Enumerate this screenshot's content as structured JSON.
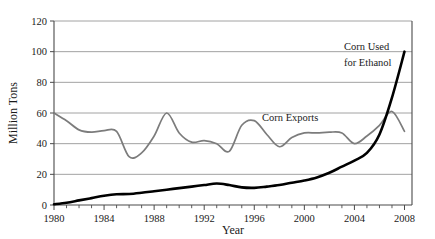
{
  "chart_data": {
    "type": "line",
    "title": "",
    "xlabel": "Year",
    "ylabel": "Million Tons",
    "xlim": [
      1980,
      2008.6
    ],
    "ylim": [
      0,
      120
    ],
    "yticks": [
      0,
      20,
      40,
      60,
      80,
      100,
      120
    ],
    "ytick_labels": [
      "0",
      "20",
      "40",
      "60",
      "80",
      "100",
      "120"
    ],
    "xticks": [
      1980,
      1984,
      1988,
      1992,
      1996,
      2000,
      2004,
      2008
    ],
    "xtick_labels": [
      "1980",
      "1984",
      "1988",
      "1992",
      "1996",
      "2000",
      "2004",
      "2008"
    ],
    "minor_xtick_interval": 1,
    "grid": "horizontal",
    "legend_position": "inline-annotations",
    "x": [
      1980,
      1981,
      1982,
      1983,
      1984,
      1985,
      1986,
      1987,
      1988,
      1989,
      1990,
      1991,
      1992,
      1993,
      1994,
      1995,
      1996,
      1997,
      1998,
      1999,
      2000,
      2001,
      2002,
      2003,
      2004,
      2005,
      2006,
      2007,
      2008
    ],
    "series": [
      {
        "name": "Corn Exports",
        "color": "#7c7c7c",
        "annotation": "Corn Exports",
        "values": [
          60,
          55,
          49,
          47.5,
          48.5,
          48,
          31.5,
          34,
          45,
          60,
          47,
          41,
          42,
          40,
          35,
          52,
          55,
          46,
          38,
          44,
          47,
          47,
          47.5,
          47,
          40,
          45,
          52,
          61,
          48
        ]
      },
      {
        "name": "Corn Used for Ethanol",
        "color": "#000000",
        "annotation_line1": "Corn Used",
        "annotation_line2": "for Ethanol",
        "values": [
          0.5,
          1.5,
          3,
          4.5,
          6,
          7,
          7.2,
          8,
          9,
          10,
          11,
          12,
          13,
          14,
          13,
          11.5,
          11.2,
          12,
          13,
          14.5,
          16,
          18,
          21,
          25,
          29,
          34,
          46,
          70,
          100
        ]
      }
    ]
  },
  "annotations": {
    "exports_label": "Corn Exports",
    "ethanol_label_line1": "Corn Used",
    "ethanol_label_line2": "for Ethanol"
  },
  "axes": {
    "y_title": "Million Tons",
    "x_title": "Year"
  }
}
